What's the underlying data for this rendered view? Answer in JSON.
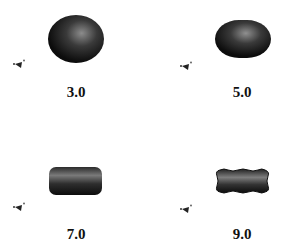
{
  "figure": {
    "panels": [
      {
        "label": "3.0",
        "shape": "sphere"
      },
      {
        "label": "5.0",
        "shape": "oblate-spheroid"
      },
      {
        "label": "7.0",
        "shape": "rounded-cylinder"
      },
      {
        "label": "9.0",
        "shape": "wavy-rounded-bar"
      }
    ],
    "colors": {
      "shape_dark": "#111111",
      "shape_highlight": "#8a8a8a",
      "label": "#111111",
      "background": "#ffffff"
    }
  }
}
